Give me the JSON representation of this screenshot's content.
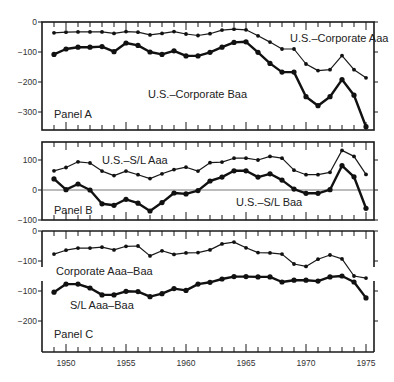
{
  "chart_data": {
    "type": "line",
    "x": [
      1949,
      1950,
      1951,
      1952,
      1953,
      1954,
      1955,
      1956,
      1957,
      1958,
      1959,
      1960,
      1961,
      1962,
      1963,
      1964,
      1965,
      1966,
      1967,
      1968,
      1969,
      1970,
      1971,
      1972,
      1973,
      1974,
      1975
    ],
    "x_ticks": [
      "1950",
      "1955",
      "1960",
      "1965",
      "1970",
      "1975"
    ],
    "x_tick_values": [
      1950,
      1955,
      1960,
      1965,
      1970,
      1975
    ],
    "panels": [
      {
        "label": "Panel A",
        "ylim": [
          -360,
          0
        ],
        "y_ticks": [
          "0",
          "-100",
          "-200",
          "-300"
        ],
        "y_tick_values": [
          0,
          -100,
          -200,
          -300
        ],
        "series": [
          {
            "name": "U.S.–Corporate Aaa",
            "style": "thin",
            "values": [
              -36,
              -34,
              -33,
              -33,
              -33,
              -38,
              -32,
              -34,
              -43,
              -38,
              -32,
              -40,
              -45,
              -39,
              -27,
              -24,
              -26,
              -46,
              -67,
              -90,
              -90,
              -140,
              -162,
              -159,
              -112,
              -159,
              -186
            ]
          },
          {
            "name": "U.S.–Corporate Baa",
            "style": "thick",
            "values": [
              -108,
              -90,
              -84,
              -84,
              -82,
              -99,
              -70,
              -78,
              -100,
              -108,
              -96,
              -113,
              -113,
              -101,
              -84,
              -68,
              -66,
              -101,
              -138,
              -167,
              -167,
              -249,
              -279,
              -249,
              -192,
              -244,
              -349
            ]
          }
        ]
      },
      {
        "label": "Panel B",
        "ylim": [
          -100,
          160
        ],
        "zero_line": true,
        "y_ticks": [
          "100",
          "0",
          "-100"
        ],
        "y_tick_values": [
          100,
          0,
          -100
        ],
        "series": [
          {
            "name": "U.S.–S/L Aaa",
            "style": "thin",
            "values": [
              64,
              75,
              94,
              90,
              63,
              48,
              63,
              51,
              38,
              54,
              68,
              76,
              63,
              91,
              93,
              106,
              106,
              100,
              112,
              106,
              66,
              51,
              51,
              59,
              132,
              112,
              52
            ]
          },
          {
            "name": "U.S.–S/L Baa",
            "style": "thick",
            "values": [
              37,
              1,
              20,
              0,
              -46,
              -51,
              -31,
              -44,
              -70,
              -42,
              -10,
              -13,
              -2,
              30,
              43,
              64,
              64,
              43,
              54,
              33,
              3,
              -11,
              -11,
              1,
              81,
              44,
              -61
            ]
          }
        ]
      },
      {
        "label": "Panel C",
        "broken_axis": true,
        "upper_ylim": [
          -120,
          0
        ],
        "lower_ylim": [
          -300,
          -70
        ],
        "upper_y_ticks": [
          "0",
          "-100"
        ],
        "upper_y_tick_values": [
          0,
          -100
        ],
        "lower_y_ticks": [
          "-100",
          "-200"
        ],
        "lower_y_tick_values": [
          -100,
          -200
        ],
        "series": [
          {
            "name": "Corporate Aaa–Baa",
            "style": "thin",
            "segment": "upper",
            "values": [
              -77,
              -64,
              -57,
              -57,
              -54,
              -63,
              -51,
              -50,
              -83,
              -66,
              -78,
              -73,
              -72,
              -63,
              -43,
              -37,
              -56,
              -72,
              -73,
              -77,
              -110,
              -118,
              -94,
              -80,
              -93,
              -150,
              -157
            ]
          },
          {
            "name": "S/L Aaa–Baa",
            "style": "thick",
            "segment": "lower",
            "values": [
              -104,
              -77,
              -77,
              -90,
              -113,
              -113,
              -101,
              -102,
              -119,
              -109,
              -92,
              -98,
              -77,
              -71,
              -60,
              -52,
              -52,
              -53,
              -53,
              -70,
              -64,
              -64,
              -67,
              -53,
              -50,
              -70,
              -123
            ]
          }
        ]
      }
    ],
    "title": "",
    "xlabel": "",
    "ylabel": "",
    "grid": false
  }
}
